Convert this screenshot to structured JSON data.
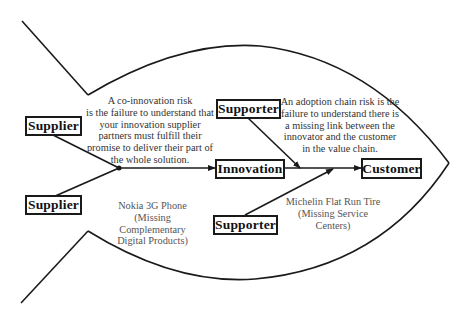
{
  "diagram": {
    "type": "fishbone",
    "nodes": {
      "supplier_top": "Supplier",
      "supplier_bottom": "Supplier",
      "supporter_top": "Supporter",
      "supporter_bottom": "Supporter",
      "innovation": "Innovation",
      "customer": "Customer"
    },
    "annotations": {
      "co_innovation_risk": "A co-innovation risk\nis the failure to understand that\nyour innovation supplier\npartners must fulfill their\npromise to deliver their part of\nthe whole solution.",
      "adoption_chain_risk": "An adoption chain risk is the\nfailure to understand there is\na missing link between the\ninnovator and the customer\nin the value chain."
    },
    "examples": {
      "nokia": "Nokia 3G Phone\n(Missing\nComplementary\nDigital Products)",
      "michelin": "Michelin Flat Run Tire\n(Missing Service\nCenters)"
    },
    "colors": {
      "stroke": "#1a1a1a",
      "text": "#111111",
      "note_text": "#333333",
      "background": "#ffffff"
    }
  }
}
